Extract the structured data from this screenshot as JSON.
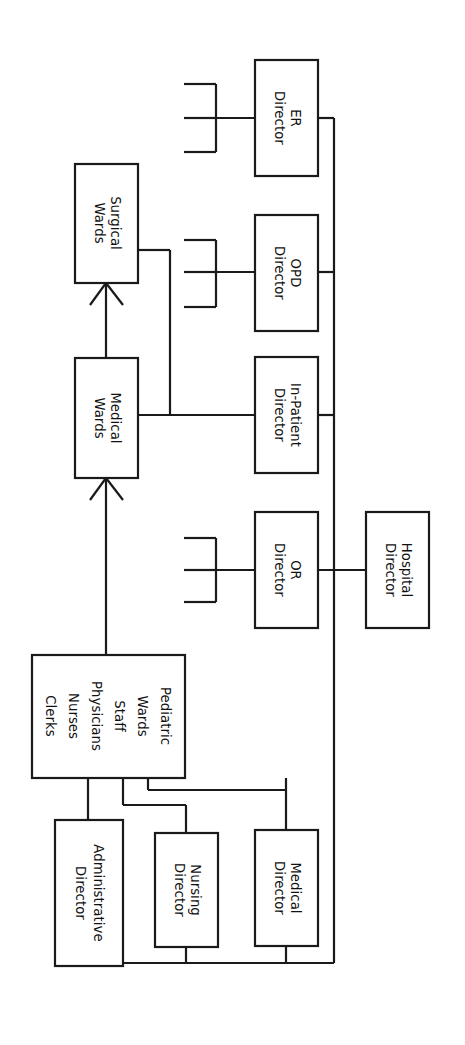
{
  "diagram": {
    "type": "org-chart",
    "orientation": "rotated-90-clockwise",
    "line_color": "#1a1a1a",
    "box_fill": "#ffffff",
    "canvas": {
      "width": 465,
      "height": 1045
    },
    "nodes": [
      {
        "id": "hospital-director",
        "lines": [
          "Hospital",
          "Director"
        ],
        "x": 366,
        "y": 512,
        "w": 63,
        "h": 116,
        "level": 0
      },
      {
        "id": "medical-director",
        "lines": [
          "Medical",
          "Director"
        ],
        "x": 255,
        "y": 830,
        "w": 63,
        "h": 116,
        "level": 1
      },
      {
        "id": "nursing-director",
        "lines": [
          "Nursing",
          "Director"
        ],
        "x": 155,
        "y": 833,
        "w": 63,
        "h": 114,
        "level": 1
      },
      {
        "id": "administrative-director",
        "lines": [
          "Administrative",
          "Director"
        ],
        "x": 55,
        "y": 820,
        "w": 68,
        "h": 146,
        "level": 1
      },
      {
        "id": "or-director",
        "lines": [
          "OR",
          "Director"
        ],
        "x": 255,
        "y": 512,
        "w": 63,
        "h": 116,
        "level": 1
      },
      {
        "id": "in-patient-director",
        "lines": [
          "In-Patient",
          "Director"
        ],
        "x": 255,
        "y": 357,
        "w": 63,
        "h": 116,
        "level": 1
      },
      {
        "id": "opd-director",
        "lines": [
          "OPD",
          "Director"
        ],
        "x": 255,
        "y": 215,
        "w": 63,
        "h": 116,
        "level": 1
      },
      {
        "id": "er-director",
        "lines": [
          "ER",
          "Director"
        ],
        "x": 255,
        "y": 60,
        "w": 63,
        "h": 116,
        "level": 1
      },
      {
        "id": "medical-wards",
        "lines": [
          "Medical",
          "Wards"
        ],
        "x": 75,
        "y": 358,
        "w": 63,
        "h": 120,
        "level": 2
      },
      {
        "id": "surgical-wards",
        "lines": [
          "Surgical",
          "Wards"
        ],
        "x": 75,
        "y": 164,
        "w": 63,
        "h": 119,
        "level": 2
      },
      {
        "id": "pediatric-wards-staff",
        "lines": [
          "Pediatric",
          "Wards",
          "Staff",
          "Physicians",
          "Nurses",
          "Clerks"
        ],
        "x": 32,
        "y": 655,
        "w": 153,
        "h": 123,
        "level": 2
      }
    ],
    "edges": [
      {
        "from": "hospital-director",
        "to": "or-director",
        "kind": "direct"
      },
      {
        "from": "hospital-director",
        "to": "in-patient-director",
        "kind": "trunk"
      },
      {
        "from": "hospital-director",
        "to": "opd-director",
        "kind": "trunk"
      },
      {
        "from": "hospital-director",
        "to": "er-director",
        "kind": "trunk"
      },
      {
        "from": "hospital-director",
        "to": "medical-director",
        "kind": "trunk"
      },
      {
        "from": "hospital-director",
        "to": "nursing-director",
        "kind": "trunk"
      },
      {
        "from": "hospital-director",
        "to": "administrative-director",
        "kind": "trunk"
      },
      {
        "from": "in-patient-director",
        "to": "medical-wards",
        "kind": "direct"
      },
      {
        "from": "in-patient-director",
        "to": "surgical-wards",
        "kind": "trunk"
      },
      {
        "from": "medical-director",
        "to": "pediatric-wards-staff",
        "kind": "trunk"
      },
      {
        "from": "nursing-director",
        "to": "pediatric-wards-staff",
        "kind": "trunk"
      },
      {
        "from": "administrative-director",
        "to": "pediatric-wards-staff",
        "kind": "trunk"
      },
      {
        "from": "pediatric-wards-staff",
        "to": "medical-wards",
        "kind": "arrow"
      },
      {
        "from": "medical-wards",
        "to": "surgical-wards",
        "kind": "arrow"
      }
    ],
    "stubs": [
      {
        "parent": "er-director",
        "count": 3
      },
      {
        "parent": "opd-director",
        "count": 3
      },
      {
        "parent": "or-director",
        "count": 3
      }
    ]
  }
}
